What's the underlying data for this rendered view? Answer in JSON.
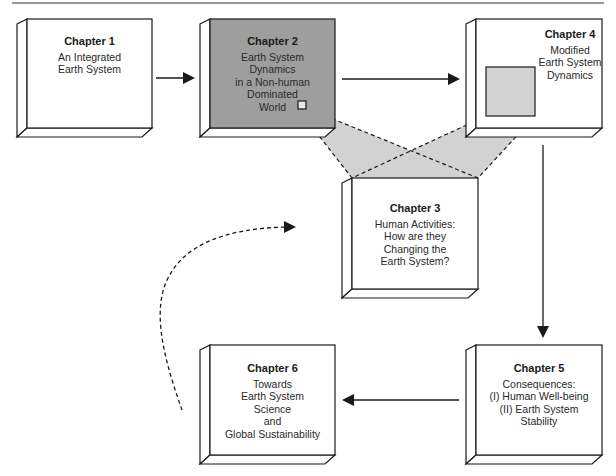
{
  "diagram": {
    "colors": {
      "stroke": "#1a1a1a",
      "box_fill": "#ffffff",
      "chapter2_fill": "#9e9e9e",
      "highlight_fill": "#d2d2d2"
    },
    "chapters": [
      {
        "id": "ch1",
        "title": "Chapter 1",
        "lines": [
          "An Integrated",
          "Earth System"
        ]
      },
      {
        "id": "ch2",
        "title": "Chapter 2",
        "lines": [
          "Earth System",
          "Dynamics",
          "in a Non-human",
          "Dominated",
          "World"
        ]
      },
      {
        "id": "ch3",
        "title": "Chapter 3",
        "lines": [
          "Human Activities:",
          "How are they",
          "Changing the",
          "Earth System?"
        ]
      },
      {
        "id": "ch4",
        "title": "Chapter 4",
        "lines": [
          "Modified",
          "Earth System",
          "Dynamics"
        ]
      },
      {
        "id": "ch5",
        "title": "Chapter 5",
        "lines": [
          "Consequences:",
          "(I) Human Well-being",
          "(II) Earth System",
          "Stability"
        ]
      },
      {
        "id": "ch6",
        "title": "Chapter 6",
        "lines": [
          "Towards",
          "Earth System",
          "Science",
          "and",
          "Global Sustainability"
        ]
      }
    ],
    "connections": [
      {
        "from": "Chapter 1",
        "to": "Chapter 2",
        "style": "solid"
      },
      {
        "from": "Chapter 2",
        "to": "Chapter 4",
        "style": "solid"
      },
      {
        "from": "Chapter 4",
        "to": "Chapter 5",
        "style": "solid"
      },
      {
        "from": "Chapter 5",
        "to": "Chapter 6",
        "style": "solid"
      },
      {
        "from": "Chapter 6",
        "to": "Chapter 3",
        "style": "dashed-curve"
      },
      {
        "from": "Chapter 2 (detail)",
        "to": "Chapter 3",
        "style": "dashed-zoom"
      },
      {
        "from": "Chapter 4 (detail)",
        "to": "Chapter 3",
        "style": "dashed-zoom"
      }
    ]
  }
}
